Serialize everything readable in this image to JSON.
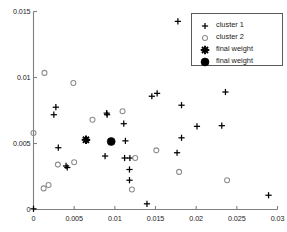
{
  "chart_data": {
    "type": "scatter",
    "title": "",
    "xlabel": "",
    "ylabel": "",
    "xlim": [
      0,
      0.03
    ],
    "ylim": [
      0,
      0.015
    ],
    "xticks": [
      "0",
      "0.005",
      "0.01",
      "0.015",
      "0.02",
      "0.025",
      "0.03"
    ],
    "xtick_values": [
      0,
      0.005,
      0.01,
      0.015,
      0.02,
      0.025,
      0.03
    ],
    "yticks": [
      "0",
      "0.005",
      "0.01",
      "0.015"
    ],
    "ytick_values": [
      0,
      0.005,
      0.01,
      0.015
    ],
    "grid": false,
    "legend_position": "top-right",
    "series": [
      {
        "name": "cluster 1",
        "marker": "plus",
        "color": "#000000",
        "points": [
          [
            0.0,
            5e-05
          ],
          [
            0.00275,
            0.00775
          ],
          [
            0.0025,
            0.00718
          ],
          [
            0.00305,
            0.00468
          ],
          [
            0.004,
            0.0033
          ],
          [
            0.00415,
            0.00318
          ],
          [
            0.0065,
            0.0053
          ],
          [
            0.00655,
            0.00525
          ],
          [
            0.009,
            0.0073
          ],
          [
            0.00905,
            0.00718
          ],
          [
            0.0088,
            0.00405
          ],
          [
            0.0111,
            0.0065
          ],
          [
            0.0113,
            0.0052
          ],
          [
            0.0112,
            0.0039
          ],
          [
            0.01185,
            0.0039
          ],
          [
            0.0118,
            0.00303
          ],
          [
            0.0118,
            0.00222
          ],
          [
            0.01395,
            0.00043
          ],
          [
            0.0152,
            0.0088
          ],
          [
            0.01455,
            0.00858
          ],
          [
            0.01775,
            0.01425
          ],
          [
            0.0182,
            0.0079
          ],
          [
            0.0182,
            0.00543
          ],
          [
            0.01765,
            0.0043
          ],
          [
            0.0201,
            0.0063
          ],
          [
            0.02315,
            0.00635
          ],
          [
            0.0236,
            0.0089
          ],
          [
            0.0289,
            0.00108
          ]
        ]
      },
      {
        "name": "cluster 2",
        "marker": "circle",
        "color": "#8c8c8c",
        "points": [
          [
            0.0,
            0.0058
          ],
          [
            0.00135,
            0.01035
          ],
          [
            0.00125,
            0.0016
          ],
          [
            0.00185,
            0.00185
          ],
          [
            0.003,
            0.0034
          ],
          [
            0.0049,
            0.00958
          ],
          [
            0.005,
            0.00358
          ],
          [
            0.00725,
            0.0068
          ],
          [
            0.01095,
            0.00745
          ],
          [
            0.0121,
            0.00152
          ],
          [
            0.0125,
            0.0039
          ],
          [
            0.0151,
            0.00448
          ],
          [
            0.0179,
            0.00285
          ],
          [
            0.0238,
            0.00222
          ]
        ]
      },
      {
        "name": "final weight",
        "marker": "star",
        "color": "#000000",
        "points": [
          [
            0.00645,
            0.00528
          ]
        ]
      },
      {
        "name": "final weight",
        "marker": "filled-circle",
        "color": "#000000",
        "points": [
          [
            0.00955,
            0.00515
          ]
        ]
      }
    ],
    "legend": [
      {
        "label": "cluster 1",
        "marker": "plus"
      },
      {
        "label": "cluster 2",
        "marker": "circle"
      },
      {
        "label": "final weight",
        "marker": "star"
      },
      {
        "label": "final weight",
        "marker": "filled-circle"
      }
    ]
  },
  "colors": {
    "axis": "#808080",
    "cluster1": "#000000",
    "cluster2": "#8c8c8c",
    "final_weight_star": "#000000",
    "final_weight_dot": "#000000",
    "legend_border": "#5a5a5a",
    "background": "#ffffff"
  }
}
